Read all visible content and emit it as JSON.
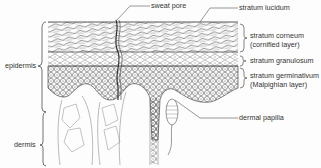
{
  "diagram": {
    "type": "anatomical cross-section",
    "labels": {
      "sweat_pore": "sweat pore",
      "stratum_lucidum": "stratum lucidum",
      "stratum_corneum": "stratum corneum",
      "stratum_corneum_alt": "(cornified layer)",
      "stratum_granulosum": "stratum granulosum",
      "stratum_germinativum": "stratum germinativum",
      "stratum_germinativum_alt": "(Malpighian layer)",
      "dermal_papilla": "dermal papilla",
      "epidermis": "epidermis",
      "dermis": "dermis"
    }
  }
}
